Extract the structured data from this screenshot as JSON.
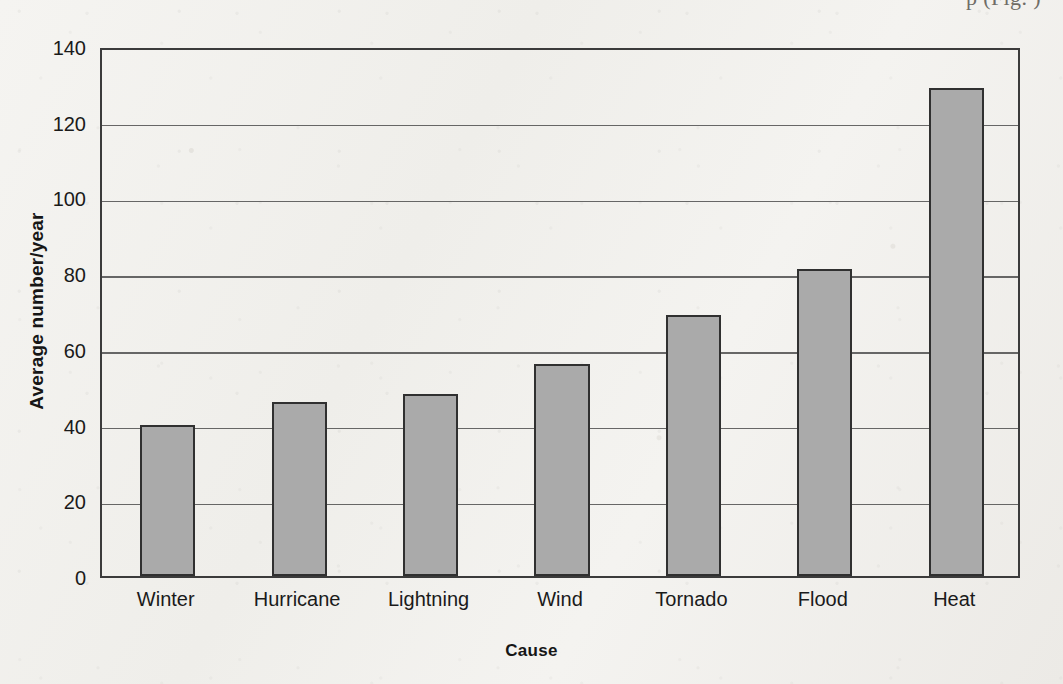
{
  "page": {
    "top_running_text": "p        (Fig.  )"
  },
  "chart_data": {
    "type": "bar",
    "title": "",
    "xlabel": "Cause",
    "ylabel": "Average number/year",
    "categories": [
      "Winter",
      "Hurricane",
      "Lightning",
      "Wind",
      "Tornado",
      "Flood",
      "Heat"
    ],
    "values": [
      40,
      46,
      48,
      56,
      69,
      81,
      129
    ],
    "ylim": [
      0,
      140
    ],
    "ytick_values": [
      0,
      20,
      40,
      60,
      80,
      100,
      120,
      140
    ],
    "ytick_labels": [
      "0",
      "20",
      "40",
      "60",
      "80",
      "100",
      "120",
      "140"
    ],
    "grid": "horizontal",
    "legend": "none",
    "bar_fill_color": "#aaaaaa",
    "bar_edge_color": "#303030",
    "axis_color": "#3b3b3b"
  }
}
